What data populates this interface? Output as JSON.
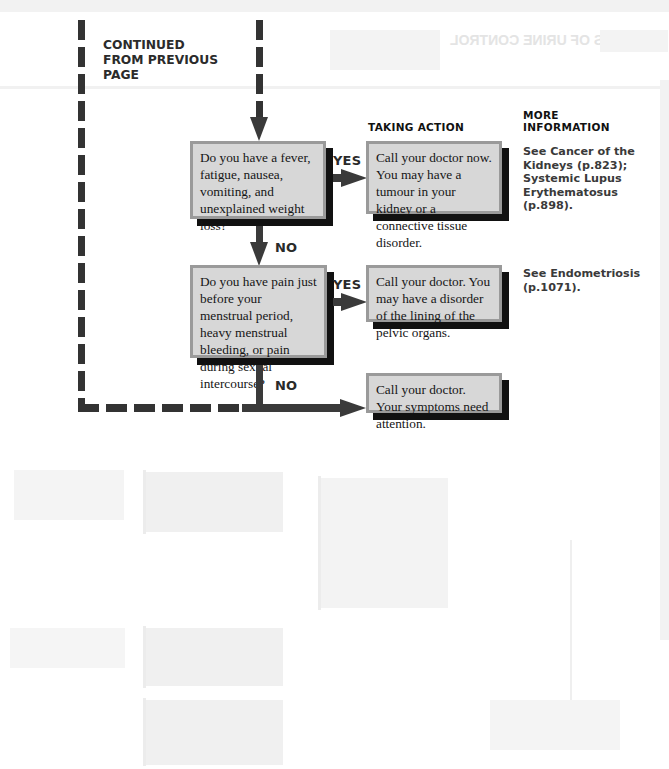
{
  "header": {
    "continued_label": "CONTINUED FROM PREVIOUS PAGE"
  },
  "columns": {
    "taking_action": "TAKING ACTION",
    "more_information": "MORE INFORMATION"
  },
  "flowchart": {
    "questions": [
      {
        "text": "Do you have a fever, fatigue, nausea, vomiting, and unexplained weight loss?",
        "yes_label": "YES",
        "no_label": "NO"
      },
      {
        "text": "Do you have pain just before your menstrual period, heavy menstrual bleeding, or pain during sexual intercourse?",
        "yes_label": "YES",
        "no_label": "NO"
      }
    ],
    "actions": [
      {
        "text": "Call your doctor now. You may have a tumour in your kidney or a connective tissue disorder."
      },
      {
        "text": "Call your doctor. You may have a disorder of the lining of the pelvic organs."
      },
      {
        "text": "Call your doctor. Your symptoms need attention."
      }
    ],
    "more_info": [
      {
        "text": "See Cancer of the Kidneys (p.823); Systemic Lupus Erythematosus (p.898)."
      },
      {
        "text": "See Endometriosis (p.1071)."
      }
    ]
  },
  "colors": {
    "box_fill": "#d7d7d7",
    "box_border": "#9a9a9a",
    "shadow": "#111111",
    "arrow": "#3a3a3a"
  }
}
